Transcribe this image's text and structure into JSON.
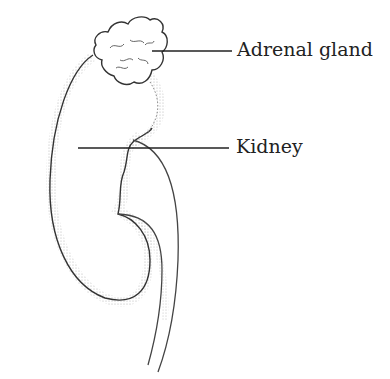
{
  "diagram": {
    "labels": [
      {
        "text": "Adrenal gland",
        "target": "adrenal-gland"
      },
      {
        "text": "Kidney",
        "target": "kidney"
      }
    ],
    "colors": {
      "line": "#333333",
      "stipple": "#888888",
      "background": "#ffffff"
    }
  }
}
